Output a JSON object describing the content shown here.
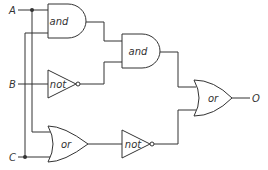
{
  "diagram": {
    "type": "logic-circuit",
    "inputs": [
      {
        "id": "A",
        "label": "A"
      },
      {
        "id": "B",
        "label": "B"
      },
      {
        "id": "C",
        "label": "C"
      }
    ],
    "output": {
      "id": "O",
      "label": "O"
    },
    "gates": [
      {
        "id": "and1",
        "label": "and",
        "inputs": [
          "A",
          "C"
        ]
      },
      {
        "id": "not1",
        "label": "not",
        "inputs": [
          "B"
        ]
      },
      {
        "id": "and2",
        "label": "and",
        "inputs": [
          "and1",
          "not1"
        ]
      },
      {
        "id": "or1",
        "label": "or",
        "inputs": [
          "A",
          "C"
        ]
      },
      {
        "id": "not2",
        "label": "not",
        "inputs": [
          "or1"
        ]
      },
      {
        "id": "or2",
        "label": "or",
        "inputs": [
          "and2",
          "not2"
        ]
      }
    ],
    "colors": {
      "line": "#333333",
      "background": "#ffffff"
    }
  }
}
